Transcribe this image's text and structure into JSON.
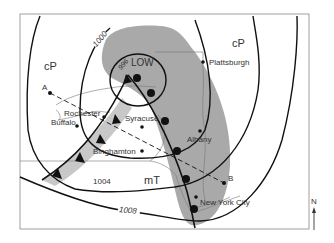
{
  "figure": {
    "type": "surface weather map",
    "system_label": "LOW",
    "north_arrow_label": "N",
    "colors": {
      "precip_shading": "#a9a9a9",
      "isobar": "#111111",
      "front": "#111111",
      "border": "#888888",
      "text": "#333333"
    }
  },
  "air_masses": [
    {
      "id": "cp-west",
      "label": "cP"
    },
    {
      "id": "cp-east",
      "label": "cP"
    },
    {
      "id": "mt",
      "label": "mT"
    }
  ],
  "isobars": [
    {
      "id": "iso-996",
      "label": "996"
    },
    {
      "id": "iso-1000",
      "label": "1000"
    },
    {
      "id": "iso-1004",
      "label": "1004"
    },
    {
      "id": "iso-1008",
      "label": "1008"
    }
  ],
  "cities": [
    {
      "id": "plattsburgh",
      "label": "Plattsburgh"
    },
    {
      "id": "rochester",
      "label": "Rochester"
    },
    {
      "id": "buffalo",
      "label": "Buffalo"
    },
    {
      "id": "syracuse",
      "label": "Syracuse"
    },
    {
      "id": "albany",
      "label": "Albany"
    },
    {
      "id": "binghamton",
      "label": "Binghamton"
    },
    {
      "id": "new-york-city",
      "label": "New York City"
    }
  ],
  "cross_section": {
    "start_label": "A",
    "end_label": "B"
  },
  "fronts": [
    {
      "id": "cold-front",
      "type": "cold"
    },
    {
      "id": "warm-front",
      "type": "warm"
    }
  ]
}
